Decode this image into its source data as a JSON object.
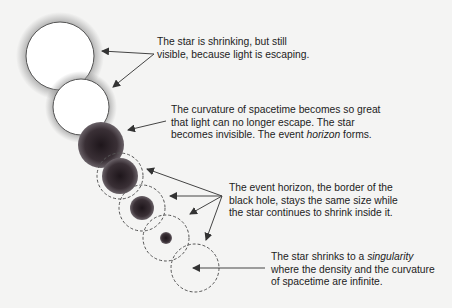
{
  "diagram": {
    "type": "black-hole-formation-sequence",
    "colors": {
      "background": "#f4f4f3",
      "star_visible_fill": "#ffffff",
      "star_outline": "#555555",
      "glow": "#9a9a9a",
      "star_collapsed": "#3a3036",
      "event_horizon_dash": "#555555",
      "arrow": "#444444",
      "text": "#1c1c1c"
    },
    "stages": [
      {
        "id": 1,
        "kind": "visible-star",
        "cx": 60,
        "cy": 56,
        "r": 34
      },
      {
        "id": 2,
        "kind": "visible-star",
        "cx": 81,
        "cy": 107,
        "r": 28
      },
      {
        "id": 3,
        "kind": "collapsed-star",
        "cx": 101,
        "cy": 145,
        "r": 23
      },
      {
        "id": 4,
        "kind": "collapsed-star-in-horizon",
        "cx": 120,
        "cy": 176,
        "star_r": 18,
        "horizon_r": 23
      },
      {
        "id": 5,
        "kind": "collapsed-star-in-horizon",
        "cx": 142,
        "cy": 208,
        "star_r": 12,
        "horizon_r": 23
      },
      {
        "id": 6,
        "kind": "collapsed-star-in-horizon",
        "cx": 166,
        "cy": 238,
        "star_r": 6,
        "horizon_r": 23
      },
      {
        "id": 7,
        "kind": "singularity-in-horizon",
        "cx": 195,
        "cy": 268,
        "star_r": 0,
        "horizon_r": 24
      }
    ],
    "captions": {
      "shrinking": {
        "line1": "The star is shrinking, but still",
        "line2": "visible, because light is escaping."
      },
      "curvature": {
        "line1": "The curvature of spacetime becomes so great",
        "line2": "that light can no longer escape. The star",
        "line3_pre": "becomes invisible. The event ",
        "line3_em": "horizon",
        "line3_post": " forms."
      },
      "horizon": {
        "line1": "The event horizon, the border of the",
        "line2": "black hole, stays the same size while",
        "line3": "the star continues to shrink inside it."
      },
      "singularity": {
        "line1_pre": "The star shrinks to a ",
        "line1_em": "singularity",
        "line2": "where the density and the curvature",
        "line3": "of spacetime are infinite."
      }
    }
  }
}
